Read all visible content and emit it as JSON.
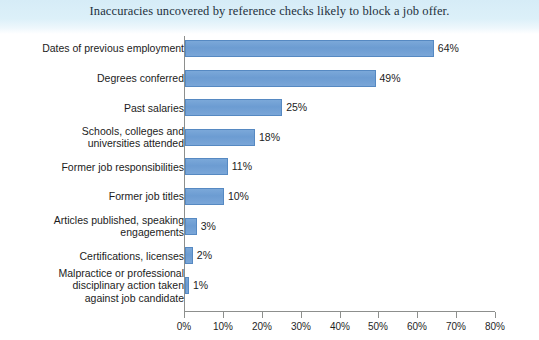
{
  "chart_data": {
    "type": "bar",
    "orientation": "horizontal",
    "title": "Inaccuracies uncovered by reference checks likely to block a job offer.",
    "xlabel": "",
    "ylabel": "",
    "xlim": [
      0,
      80
    ],
    "xticks": [
      "0%",
      "10%",
      "20%",
      "30%",
      "40%",
      "50%",
      "60%",
      "70%",
      "80%"
    ],
    "xtick_values": [
      0,
      10,
      20,
      30,
      40,
      50,
      60,
      70,
      80
    ],
    "grid": false,
    "legend": null,
    "bar_color": "#6e9ed4",
    "bar_border_color": "#5689c2",
    "axis_color": "#8d8f8d",
    "categories": [
      "Dates of previous employment",
      "Degrees conferred",
      "Past salaries",
      "Schools, colleges and\nuniversities attended",
      "Former job responsibilities",
      "Former job titles",
      "Articles published, speaking\nengagements",
      "Certifications, licenses",
      "Malpractice or professional\ndisciplinary action taken\nagainst job candidate"
    ],
    "values": [
      64,
      49,
      25,
      18,
      11,
      10,
      3,
      2,
      1
    ],
    "data_labels": [
      "64%",
      "49%",
      "25%",
      "18%",
      "11%",
      "10%",
      "3%",
      "2%",
      "1%"
    ]
  },
  "colors": {
    "band_top": "#d6ecf7",
    "band_bottom": "#ffffff",
    "title_text": "#23303c",
    "label_text": "#1c1c1c"
  }
}
